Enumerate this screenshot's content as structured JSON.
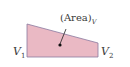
{
  "diagram": {
    "area_label": "(Area)",
    "area_subscript": "V",
    "left_label": "V",
    "left_subscript": "1",
    "right_label": "V",
    "right_subscript": "2",
    "fill_color": "#e9b8c3",
    "stroke_color": "#6b5a88"
  }
}
